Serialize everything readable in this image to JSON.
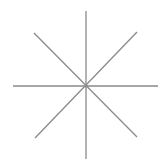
{
  "diagram": {
    "type": "eight-ray-star",
    "stroke_color": "#8a8a8a",
    "stroke_width": 1.3,
    "center": [
      86,
      86
    ],
    "rays": [
      {
        "name": "vertical",
        "x1": 86,
        "y1": 11,
        "x2": 86,
        "y2": 159
      },
      {
        "name": "horizontal",
        "x1": 13,
        "y1": 86,
        "x2": 158,
        "y2": 86
      },
      {
        "name": "diagonal-down",
        "x1": 34,
        "y1": 33,
        "x2": 137,
        "y2": 137
      },
      {
        "name": "diagonal-up",
        "x1": 35,
        "y1": 138,
        "x2": 137,
        "y2": 32
      }
    ]
  }
}
